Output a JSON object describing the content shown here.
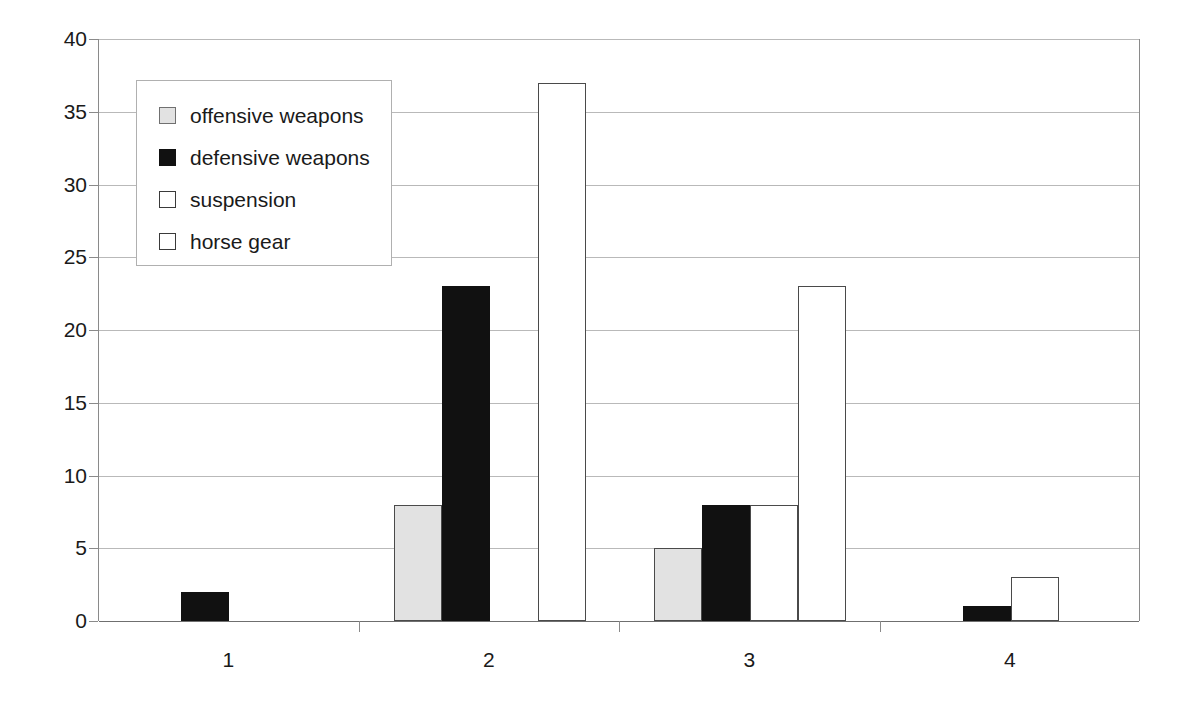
{
  "chart_data": {
    "type": "bar",
    "title": "",
    "subtitle": "",
    "xlabel": "",
    "ylabel": "",
    "categories": [
      "1",
      "2",
      "3",
      "4"
    ],
    "ylim": [
      0,
      40
    ],
    "ytick_labels": [
      "0",
      "5",
      "10",
      "15",
      "20",
      "25",
      "30",
      "35",
      "40"
    ],
    "ytick_values": [
      0,
      5,
      10,
      15,
      20,
      25,
      30,
      35,
      40
    ],
    "grid": true,
    "legend_position": "top-left-inside",
    "series": [
      {
        "name": "offensive weapons",
        "color": "#e2e2e2",
        "values": [
          0,
          8,
          5,
          0
        ]
      },
      {
        "name": "defensive weapons",
        "color": "#111111",
        "values": [
          2,
          23,
          8,
          1
        ]
      },
      {
        "name": "suspension",
        "color": "#ffffff",
        "values": [
          0,
          0,
          8,
          3
        ]
      },
      {
        "name": "horse gear",
        "color": "#ffffff",
        "values": [
          0,
          37,
          23,
          0
        ]
      }
    ]
  },
  "legend": {
    "items": [
      {
        "label": "offensive weapons",
        "swatch": "offensive"
      },
      {
        "label": "defensive weapons",
        "swatch": "defensive"
      },
      {
        "label": "suspension",
        "swatch": "suspension"
      },
      {
        "label": "horse gear",
        "swatch": "horsegear"
      }
    ]
  }
}
